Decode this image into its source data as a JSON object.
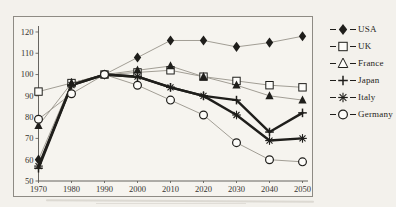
{
  "chart_data": {
    "type": "line",
    "title": "",
    "xlabel": "",
    "ylabel": "",
    "x_labels": [
      "1970",
      "1980",
      "1990",
      "2000",
      "2010",
      "2020",
      "2030",
      "2040",
      "2050"
    ],
    "y_ticks": [
      50,
      60,
      70,
      80,
      90,
      100,
      110,
      120
    ],
    "ylim": [
      50,
      120
    ],
    "grid": false,
    "legend_position": "right-outside",
    "ink_color": "#1f1e1b",
    "thin_line_color": "#a29e95",
    "thick_line_color": "#1f1e1b",
    "series": [
      {
        "name": "USA",
        "marker": "diamond-filled",
        "legend_marker": "diamond-filled",
        "line": "thin",
        "values": [
          60,
          96,
          100,
          108,
          116,
          116,
          113,
          115,
          118
        ]
      },
      {
        "name": "UK",
        "marker": "square-open",
        "legend_marker": "square-open",
        "line": "thin",
        "values": [
          92,
          96,
          100,
          101,
          102,
          99,
          97,
          95,
          94
        ]
      },
      {
        "name": "France",
        "marker": "triangle-filled",
        "legend_marker": "triangle-open",
        "line": "thin",
        "values": [
          76,
          96,
          100,
          102,
          104,
          99,
          95,
          90,
          88
        ]
      },
      {
        "name": "Japan",
        "marker": "plus",
        "legend_marker": "plus",
        "line": "thick",
        "values": [
          56,
          95,
          100,
          99,
          94,
          90,
          88,
          73,
          82
        ]
      },
      {
        "name": "Italy",
        "marker": "asterisk",
        "legend_marker": "asterisk",
        "line": "thick",
        "values": [
          57,
          95,
          100,
          99,
          94,
          90,
          81,
          69,
          70
        ]
      },
      {
        "name": "Germany",
        "marker": "circle-open",
        "legend_marker": "circle-open",
        "line": "thin",
        "values": [
          79,
          91,
          100,
          95,
          88,
          81,
          68,
          60,
          59
        ]
      }
    ]
  }
}
